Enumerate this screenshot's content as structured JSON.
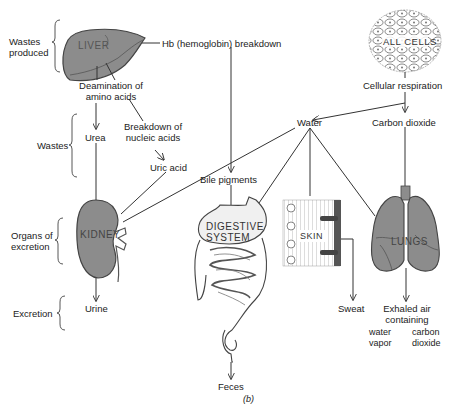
{
  "figure": {
    "caption": "(b)",
    "brackets": {
      "wastes_produced": "Wastes produced",
      "wastes": "Wastes",
      "organs_of_excretion": "Organs of excretion",
      "excretion": "Excretion"
    },
    "organs": {
      "liver": "LIVER",
      "all_cells": "ALL CELLS",
      "kidney": "KIDNEY",
      "digestive_system": "DIGESTIVE SYSTEM",
      "skin": "SKIN",
      "lungs": "LUNGS"
    },
    "nodes": {
      "hb_breakdown": "Hb (hemoglobin) breakdown",
      "cellular_respiration": "Cellular respiration",
      "deamination": "Deamination of amino acids",
      "breakdown_nucleic": "Breakdown of nucleic acids",
      "urea": "Urea",
      "uric_acid": "Uric acid",
      "water": "Water",
      "carbon_dioxide": "Carbon dioxide",
      "bile_pigments": "Bile pigments",
      "urine": "Urine",
      "feces": "Feces",
      "sweat": "Sweat",
      "exhaled_air": "Exhaled air containing",
      "water_vapor": "water vapor",
      "carbon_dioxide_out": "carbon dioxide"
    },
    "colors": {
      "organ_fill": "#8c8c8c",
      "organ_stroke": "#444444",
      "line": "#333333",
      "light_fill": "#e8e8e8"
    }
  }
}
